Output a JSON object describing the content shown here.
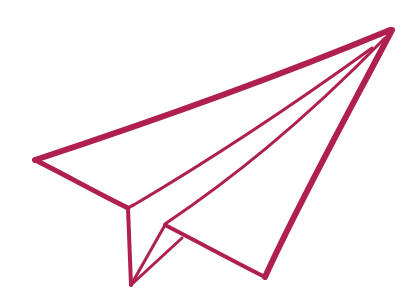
{
  "illustration": {
    "subject": "paper airplane",
    "stroke_color": "#b0204f",
    "background_color": "#ffffff"
  }
}
